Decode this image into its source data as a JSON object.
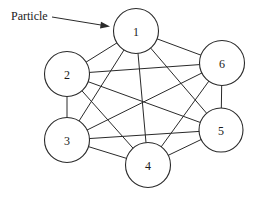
{
  "diagram": {
    "type": "complete-graph",
    "callout": {
      "label": "Particle",
      "target_node": "1"
    },
    "nodes": [
      {
        "id": "1",
        "label": "1"
      },
      {
        "id": "2",
        "label": "2"
      },
      {
        "id": "3",
        "label": "3"
      },
      {
        "id": "4",
        "label": "4"
      },
      {
        "id": "5",
        "label": "5"
      },
      {
        "id": "6",
        "label": "6"
      }
    ],
    "edges": [
      [
        "1",
        "2"
      ],
      [
        "1",
        "3"
      ],
      [
        "1",
        "4"
      ],
      [
        "1",
        "5"
      ],
      [
        "1",
        "6"
      ],
      [
        "2",
        "3"
      ],
      [
        "2",
        "4"
      ],
      [
        "2",
        "5"
      ],
      [
        "2",
        "6"
      ],
      [
        "3",
        "4"
      ],
      [
        "3",
        "5"
      ],
      [
        "3",
        "6"
      ],
      [
        "4",
        "5"
      ],
      [
        "4",
        "6"
      ],
      [
        "5",
        "6"
      ]
    ]
  }
}
